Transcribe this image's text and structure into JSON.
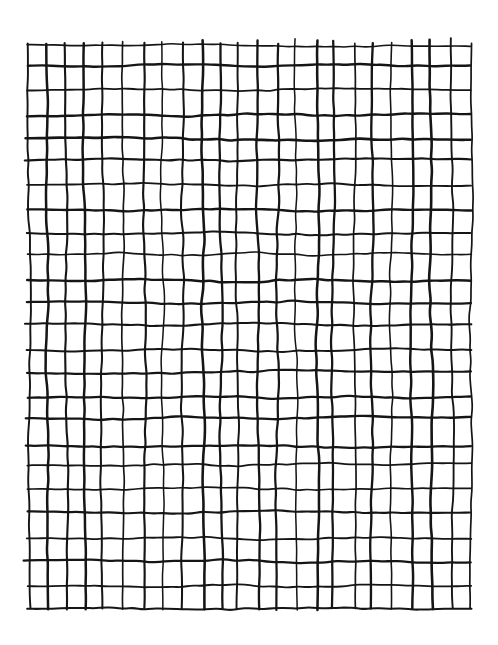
{
  "artwork": {
    "title": "Hand-drawn grid",
    "medium": "ink on paper",
    "background_color": "#ffffff",
    "ink_color": "#151515"
  },
  "grid": {
    "columns": 23,
    "rows": 24,
    "left": 28,
    "top": 44,
    "right": 470,
    "bottom": 608,
    "cell_width": 19.2,
    "cell_height": 23.5,
    "stroke_width_min": 1.5,
    "stroke_width_max": 2.6,
    "wobble_amplitude": 1.9,
    "overshoot_max": 5,
    "seed": 20240517
  },
  "canvas": {
    "width": 498,
    "height": 645
  }
}
